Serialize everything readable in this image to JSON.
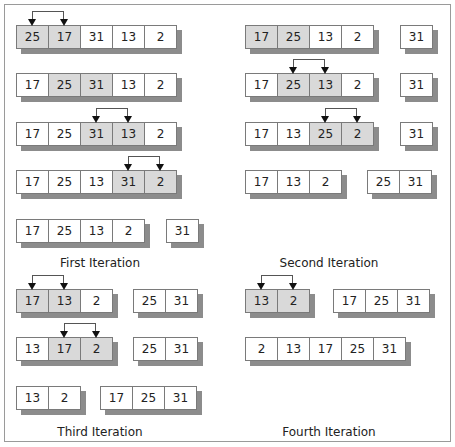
{
  "colors": {
    "highlight": "#d9d9d9",
    "border": "#7a7a7a",
    "shadow": "#8c8c8c"
  },
  "panels": [
    {
      "label": "First Iteration",
      "rows": [
        {
          "groups": [
            {
              "values": [
                "25",
                "17",
                "31",
                "13",
                "2"
              ],
              "highlight": [
                0,
                1
              ]
            }
          ],
          "swap": [
            0,
            1
          ]
        },
        {
          "groups": [
            {
              "values": [
                "17",
                "25",
                "31",
                "13",
                "2"
              ],
              "highlight": [
                1,
                2
              ]
            }
          ],
          "swap": null
        },
        {
          "groups": [
            {
              "values": [
                "17",
                "25",
                "31",
                "13",
                "2"
              ],
              "highlight": [
                2,
                3
              ]
            }
          ],
          "swap": [
            2,
            3
          ]
        },
        {
          "groups": [
            {
              "values": [
                "17",
                "25",
                "13",
                "31",
                "2"
              ],
              "highlight": [
                3,
                4
              ]
            }
          ],
          "swap": [
            3,
            4
          ]
        },
        {
          "groups": [
            {
              "values": [
                "17",
                "25",
                "13",
                "2"
              ],
              "highlight": []
            },
            {
              "values": [
                "31"
              ],
              "highlight": []
            }
          ],
          "swap": null
        }
      ]
    },
    {
      "label": "Second Iteration",
      "rows": [
        {
          "groups": [
            {
              "values": [
                "17",
                "25",
                "13",
                "2"
              ],
              "highlight": [
                0,
                1
              ]
            },
            {
              "values": [
                "31"
              ],
              "highlight": []
            }
          ],
          "swap": null
        },
        {
          "groups": [
            {
              "values": [
                "17",
                "25",
                "13",
                "2"
              ],
              "highlight": [
                1,
                2
              ]
            },
            {
              "values": [
                "31"
              ],
              "highlight": []
            }
          ],
          "swap": [
            1,
            2
          ]
        },
        {
          "groups": [
            {
              "values": [
                "17",
                "13",
                "25",
                "2"
              ],
              "highlight": [
                2,
                3
              ]
            },
            {
              "values": [
                "31"
              ],
              "highlight": []
            }
          ],
          "swap": [
            2,
            3
          ]
        },
        {
          "groups": [
            {
              "values": [
                "17",
                "13",
                "2"
              ],
              "highlight": []
            },
            {
              "values": [
                "25",
                "31"
              ],
              "highlight": []
            }
          ],
          "swap": null
        }
      ]
    },
    {
      "label": "Third Iteration",
      "rows": [
        {
          "groups": [
            {
              "values": [
                "17",
                "13",
                "2"
              ],
              "highlight": [
                0,
                1
              ]
            },
            {
              "values": [
                "25",
                "31"
              ],
              "highlight": []
            }
          ],
          "swap": [
            0,
            1
          ]
        },
        {
          "groups": [
            {
              "values": [
                "13",
                "17",
                "2"
              ],
              "highlight": [
                1,
                2
              ]
            },
            {
              "values": [
                "25",
                "31"
              ],
              "highlight": []
            }
          ],
          "swap": [
            1,
            2
          ]
        },
        {
          "groups": [
            {
              "values": [
                "13",
                "2"
              ],
              "highlight": []
            },
            {
              "values": [
                "17",
                "25",
                "31"
              ],
              "highlight": []
            }
          ],
          "swap": null
        }
      ]
    },
    {
      "label": "Fourth Iteration",
      "rows": [
        {
          "groups": [
            {
              "values": [
                "13",
                "2"
              ],
              "highlight": [
                0,
                1
              ]
            },
            {
              "values": [
                "17",
                "25",
                "31"
              ],
              "highlight": []
            }
          ],
          "swap": [
            0,
            1
          ]
        },
        {
          "groups": [
            {
              "values": [
                "2",
                "13",
                "17",
                "25",
                "31"
              ],
              "highlight": []
            }
          ],
          "swap": null
        }
      ]
    }
  ]
}
